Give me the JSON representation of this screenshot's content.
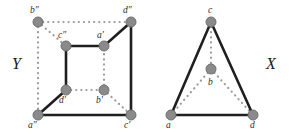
{
  "figure": {
    "background": "#ffffff",
    "node_fill": "#8a8a8a",
    "node_stroke": "#6f6f6f",
    "solid_edge_color": "#1f1f1f",
    "dotted_edge_color": "#9a9a9a"
  },
  "graphs": [
    {
      "id": "Y",
      "name": "cube-graph",
      "label": "Y",
      "label_pos": {
        "x": 12,
        "y": 56
      },
      "nodes": [
        {
          "id": "b2",
          "label": "b″",
          "x": 38,
          "y": 22,
          "label_x": 30,
          "label_y": 6
        },
        {
          "id": "d2",
          "label": "d″",
          "x": 131,
          "y": 22,
          "label_x": 123,
          "label_y": 6
        },
        {
          "id": "c2",
          "label": "c″",
          "x": 66,
          "y": 46,
          "label_x": 58,
          "label_y": 31
        },
        {
          "id": "a1",
          "label": "a′",
          "x": 104,
          "y": 46,
          "label_x": 97,
          "label_y": 31
        },
        {
          "id": "d1",
          "label": "d′",
          "x": 66,
          "y": 90,
          "label_x": 59,
          "label_y": 96
        },
        {
          "id": "b1",
          "label": "b′",
          "x": 104,
          "y": 90,
          "label_x": 96,
          "label_y": 96
        },
        {
          "id": "a2",
          "label": "a″",
          "x": 38,
          "y": 115,
          "label_x": 28,
          "label_y": 121
        },
        {
          "id": "c1",
          "label": "c′",
          "x": 131,
          "y": 115,
          "label_x": 124,
          "label_y": 121
        }
      ],
      "edges": [
        {
          "from": "c2",
          "to": "a1",
          "style": "solid"
        },
        {
          "from": "c2",
          "to": "d1",
          "style": "solid"
        },
        {
          "from": "a1",
          "to": "d2",
          "style": "solid"
        },
        {
          "from": "d2",
          "to": "c1",
          "style": "solid"
        },
        {
          "from": "d1",
          "to": "a2",
          "style": "solid"
        },
        {
          "from": "a2",
          "to": "c1",
          "style": "solid"
        },
        {
          "from": "b2",
          "to": "d2",
          "style": "dotted"
        },
        {
          "from": "b2",
          "to": "a2",
          "style": "dotted"
        },
        {
          "from": "b2",
          "to": "c2",
          "style": "dotted"
        },
        {
          "from": "d1",
          "to": "b1",
          "style": "dotted"
        },
        {
          "from": "b1",
          "to": "a1",
          "style": "dotted"
        },
        {
          "from": "b1",
          "to": "c1",
          "style": "dotted"
        }
      ]
    },
    {
      "id": "X",
      "name": "triangle-graph",
      "label": "X",
      "label_pos": {
        "x": 266,
        "y": 56
      },
      "nodes": [
        {
          "id": "c",
          "label": "c",
          "x": 211,
          "y": 22,
          "label_x": 208,
          "label_y": 6
        },
        {
          "id": "b",
          "label": "b",
          "x": 211,
          "y": 69,
          "label_x": 208,
          "label_y": 78
        },
        {
          "id": "a",
          "label": "a",
          "x": 171,
          "y": 115,
          "label_x": 166,
          "label_y": 121
        },
        {
          "id": "d",
          "label": "d",
          "x": 253,
          "y": 115,
          "label_x": 250,
          "label_y": 121
        }
      ],
      "edges": [
        {
          "from": "a",
          "to": "c",
          "style": "solid"
        },
        {
          "from": "c",
          "to": "d",
          "style": "solid"
        },
        {
          "from": "a",
          "to": "d",
          "style": "solid"
        },
        {
          "from": "c",
          "to": "b",
          "style": "dotted"
        },
        {
          "from": "b",
          "to": "a",
          "style": "dotted"
        },
        {
          "from": "b",
          "to": "d",
          "style": "dotted"
        }
      ]
    }
  ]
}
